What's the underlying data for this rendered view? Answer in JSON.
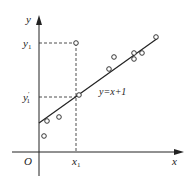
{
  "diagram": {
    "title": "",
    "axes": {
      "x_label": "x",
      "y_label": "y",
      "origin_label": "O"
    },
    "regression_line": {
      "label": "y=x+1",
      "color": "#222222"
    },
    "markers": {
      "x1_label": "x",
      "x1_sub": "1",
      "y1_label": "y",
      "y1_sub": "1",
      "y1_prime_label": "y",
      "y1_prime_sub": "1",
      "y1_prime_mark": "′"
    },
    "points": [
      {
        "x": 44,
        "y": 136
      },
      {
        "x": 47,
        "y": 121
      },
      {
        "x": 59,
        "y": 117
      },
      {
        "x": 76,
        "y": 43
      },
      {
        "x": 79,
        "y": 95
      },
      {
        "x": 109,
        "y": 69
      },
      {
        "x": 114,
        "y": 57
      },
      {
        "x": 134,
        "y": 53
      },
      {
        "x": 134,
        "y": 59
      },
      {
        "x": 142,
        "y": 53
      },
      {
        "x": 156,
        "y": 37
      }
    ]
  },
  "chart_data": {
    "type": "scatter",
    "title": "",
    "xlabel": "x",
    "ylabel": "y",
    "annotations": [
      "y=x+1",
      "x1",
      "y1",
      "y1'",
      "O"
    ],
    "fit_line": "y=x+1",
    "grid": false
  }
}
